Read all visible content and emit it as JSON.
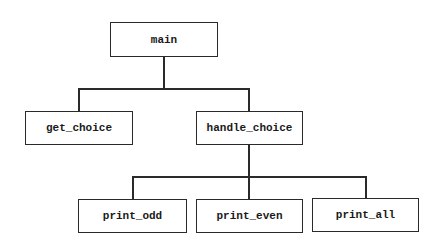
{
  "diagram": {
    "type": "hierarchy-chart",
    "nodes": {
      "main": "main",
      "get_choice": "get_choice",
      "handle_choice": "handle_choice",
      "print_odd": "print_odd",
      "print_even": "print_even",
      "print_all": "print_all"
    },
    "edges": [
      {
        "from": "main",
        "to": "get_choice"
      },
      {
        "from": "main",
        "to": "handle_choice"
      },
      {
        "from": "handle_choice",
        "to": "print_odd"
      },
      {
        "from": "handle_choice",
        "to": "print_even"
      },
      {
        "from": "handle_choice",
        "to": "print_all"
      }
    ],
    "colors": {
      "line": "#2a2a2a",
      "box_fill": "#ffffff",
      "text": "#1a1a1a"
    }
  }
}
